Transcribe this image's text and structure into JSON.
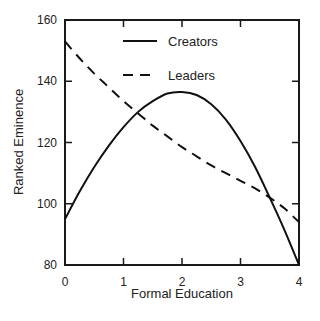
{
  "chart_data": {
    "type": "line",
    "title": "",
    "xlabel": "Formal Education",
    "ylabel": "Ranked Eminence",
    "xlim": [
      0,
      4
    ],
    "ylim": [
      80,
      160
    ],
    "xticks": [
      0,
      1,
      2,
      3,
      4
    ],
    "yticks": [
      80,
      100,
      120,
      140,
      160
    ],
    "grid": false,
    "legend_position": "top-center-inside",
    "series": [
      {
        "name": "Creators",
        "style": "solid",
        "x": [
          0,
          0.25,
          0.5,
          0.75,
          1.0,
          1.25,
          1.5,
          1.75,
          2.0,
          2.25,
          2.5,
          2.75,
          3.0,
          3.25,
          3.5,
          3.75,
          4.0
        ],
        "values": [
          95,
          104,
          112,
          119,
          125,
          130,
          133.5,
          136,
          136.5,
          135.5,
          132.5,
          127.5,
          120.5,
          112,
          102,
          91.5,
          80
        ]
      },
      {
        "name": "Leaders",
        "style": "dashed",
        "x": [
          0,
          0.25,
          0.5,
          0.75,
          1.0,
          1.25,
          1.5,
          1.75,
          2.0,
          2.25,
          2.5,
          2.75,
          3.0,
          3.25,
          3.5,
          3.75,
          4.0
        ],
        "values": [
          153,
          147.5,
          142.5,
          138,
          133.5,
          129.5,
          125.5,
          122,
          118.5,
          115.5,
          112.5,
          110,
          107.5,
          105,
          102,
          98.5,
          94
        ]
      }
    ]
  }
}
